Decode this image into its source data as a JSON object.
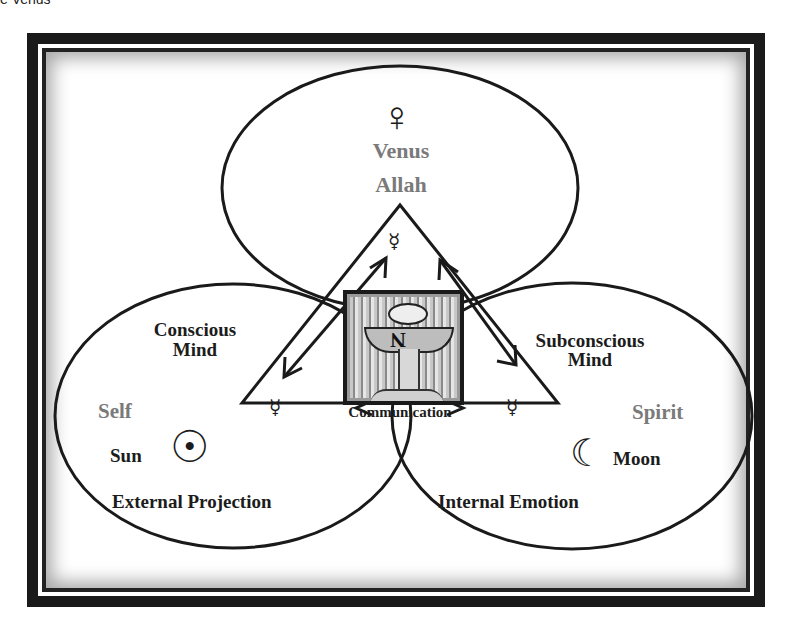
{
  "caption": "e Venus",
  "diagram": {
    "top": {
      "symbol": "♀",
      "title": "Venus",
      "subtitle": "Allah",
      "triangle_symbol": "☿"
    },
    "left": {
      "heading_line1": "Conscious",
      "heading_line2": "Mind",
      "aspect": "Self",
      "body_label": "Sun",
      "body_symbol": "☉",
      "footer": "External Projection",
      "triangle_symbol": "☿"
    },
    "right": {
      "heading_line1": "Subconscious",
      "heading_line2": "Mind",
      "aspect": "Spirit",
      "body_label": "Moon",
      "body_symbol": "☾",
      "footer": "Internal Emotion",
      "triangle_symbol": "☿"
    },
    "center": {
      "label": "Communication",
      "card_letter": "N"
    },
    "colors": {
      "line": "#1a1a1a",
      "grey_text": "#7a7a7a",
      "dark_text": "#1c1c1c",
      "frame": "#1a1a1a"
    }
  }
}
